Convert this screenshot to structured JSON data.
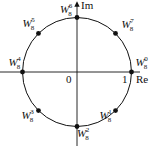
{
  "diagram": {
    "axes": {
      "real_label": "Re",
      "imag_label": "Im",
      "origin_label": "0",
      "unit_label": "1"
    },
    "points": [
      {
        "base": "W",
        "sub": "8",
        "sup": "0",
        "angle_deg": 0
      },
      {
        "base": "W",
        "sub": "8",
        "sup": "1",
        "angle_deg": -45
      },
      {
        "base": "W",
        "sub": "8",
        "sup": "2",
        "angle_deg": -90
      },
      {
        "base": "W",
        "sub": "8",
        "sup": "3",
        "angle_deg": -135
      },
      {
        "base": "W",
        "sub": "8",
        "sup": "4",
        "angle_deg": 180
      },
      {
        "base": "W",
        "sub": "8",
        "sup": "5",
        "angle_deg": 135
      },
      {
        "base": "W",
        "sub": "8",
        "sup": "6",
        "angle_deg": 90
      },
      {
        "base": "W",
        "sub": "8",
        "sup": "7",
        "angle_deg": 45
      }
    ]
  }
}
